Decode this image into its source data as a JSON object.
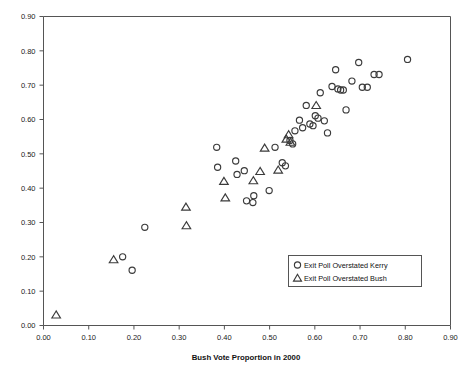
{
  "chart_data": {
    "type": "scatter",
    "title": "",
    "xlabel": "Bush Vote Proportion in 2000",
    "ylabel": "",
    "xlim": [
      0.0,
      0.9
    ],
    "ylim": [
      0.0,
      0.9
    ],
    "xticks": [
      "0.00",
      "0.10",
      "0.20",
      "0.30",
      "0.40",
      "0.50",
      "0.60",
      "0.70",
      "0.80",
      "0.90"
    ],
    "yticks": [
      "0.00",
      "0.10",
      "0.20",
      "0.30",
      "0.40",
      "0.50",
      "0.60",
      "0.70",
      "0.80",
      "0.90"
    ],
    "xtick_values": [
      0.0,
      0.1,
      0.2,
      0.3,
      0.4,
      0.5,
      0.6,
      0.7,
      0.8,
      0.9
    ],
    "ytick_values": [
      0.0,
      0.1,
      0.2,
      0.3,
      0.4,
      0.5,
      0.6,
      0.7,
      0.8,
      0.9
    ],
    "grid": false,
    "legend_position": "inside-lower-right",
    "marker_color": "#3b3b3b",
    "series": [
      {
        "name": "Exit Poll Overstated Kerry",
        "marker": "circle",
        "points": [
          [
            0.175,
            0.2
          ],
          [
            0.196,
            0.161
          ],
          [
            0.224,
            0.286
          ],
          [
            0.383,
            0.519
          ],
          [
            0.385,
            0.461
          ],
          [
            0.425,
            0.479
          ],
          [
            0.428,
            0.44
          ],
          [
            0.444,
            0.451
          ],
          [
            0.449,
            0.363
          ],
          [
            0.463,
            0.358
          ],
          [
            0.465,
            0.378
          ],
          [
            0.499,
            0.393
          ],
          [
            0.512,
            0.519
          ],
          [
            0.528,
            0.474
          ],
          [
            0.535,
            0.465
          ],
          [
            0.545,
            0.539
          ],
          [
            0.551,
            0.529
          ],
          [
            0.556,
            0.567
          ],
          [
            0.566,
            0.598
          ],
          [
            0.573,
            0.576
          ],
          [
            0.581,
            0.641
          ],
          [
            0.589,
            0.587
          ],
          [
            0.596,
            0.582
          ],
          [
            0.601,
            0.611
          ],
          [
            0.607,
            0.604
          ],
          [
            0.612,
            0.678
          ],
          [
            0.621,
            0.596
          ],
          [
            0.628,
            0.561
          ],
          [
            0.638,
            0.696
          ],
          [
            0.646,
            0.745
          ],
          [
            0.651,
            0.689
          ],
          [
            0.657,
            0.686
          ],
          [
            0.663,
            0.686
          ],
          [
            0.669,
            0.628
          ],
          [
            0.682,
            0.712
          ],
          [
            0.697,
            0.766
          ],
          [
            0.705,
            0.694
          ],
          [
            0.716,
            0.694
          ],
          [
            0.731,
            0.731
          ],
          [
            0.742,
            0.731
          ],
          [
            0.805,
            0.775
          ]
        ]
      },
      {
        "name": "Exit Poll Overstated Bush",
        "marker": "triangle",
        "points": [
          [
            0.028,
            0.031
          ],
          [
            0.155,
            0.192
          ],
          [
            0.315,
            0.345
          ],
          [
            0.316,
            0.291
          ],
          [
            0.399,
            0.42
          ],
          [
            0.402,
            0.372
          ],
          [
            0.464,
            0.422
          ],
          [
            0.479,
            0.449
          ],
          [
            0.489,
            0.517
          ],
          [
            0.519,
            0.453
          ],
          [
            0.537,
            0.543
          ],
          [
            0.542,
            0.556
          ],
          [
            0.546,
            0.534
          ],
          [
            0.603,
            0.641
          ]
        ]
      }
    ]
  },
  "legend": {
    "items": [
      {
        "marker": "circle-icon",
        "label": "Exit Poll Overstated Kerry"
      },
      {
        "marker": "triangle-icon",
        "label": "Exit Poll Overstated Bush"
      }
    ]
  }
}
